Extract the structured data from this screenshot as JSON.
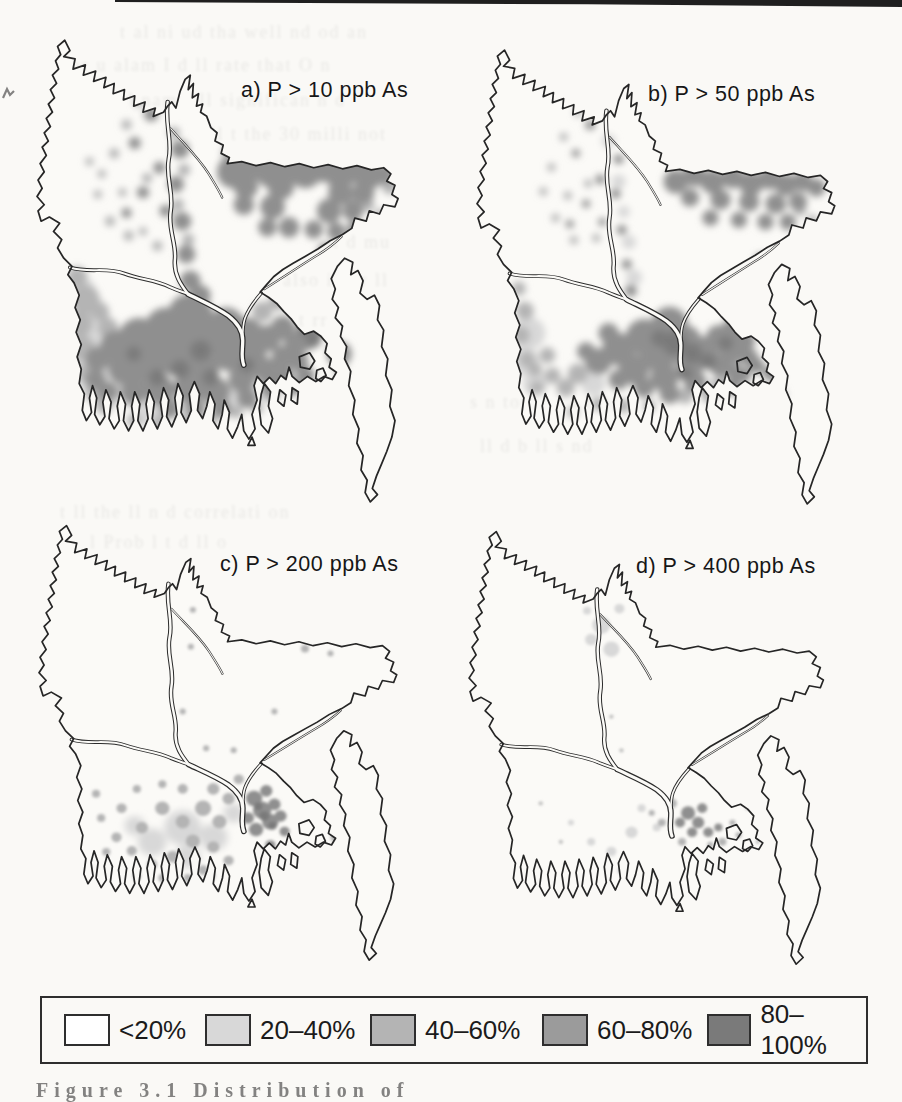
{
  "figure": {
    "maps": [
      {
        "id": "a",
        "title": "a) P > 10 ppb As"
      },
      {
        "id": "b",
        "title": "b) P > 50 ppb As"
      },
      {
        "id": "c",
        "title": "c) P > 200 ppb As"
      },
      {
        "id": "d",
        "title": "d) P > 400 ppb As"
      }
    ],
    "legend": {
      "items": [
        {
          "label": "<20%",
          "color": "#ffffff"
        },
        {
          "label": "20–40%",
          "color": "#d8d8d8"
        },
        {
          "label": "40–60%",
          "color": "#b4b4b4"
        },
        {
          "label": "60–80%",
          "color": "#9b9b9b"
        },
        {
          "label": "80–100%",
          "color": "#7a7a7a"
        }
      ]
    },
    "caption_partial": "Figure 3.1   Distribution of"
  },
  "bleedthrough": {
    "lines": [
      {
        "x": 120,
        "y": 22,
        "size": 18,
        "text": "t al ni  ud  tha  well  nd  od  an"
      },
      {
        "x": 60,
        "y": 55,
        "size": 18,
        "text": "ppr  u  alam  I  d  ll  rate that  O  n"
      },
      {
        "x": 75,
        "y": 90,
        "size": 18,
        "text": "al  r  nd  nam  I  ll  significan  n  d"
      },
      {
        "x": 55,
        "y": 124,
        "size": 18,
        "text": "s the number  r  d  ll  t   the 30 milli  not"
      },
      {
        "x": 90,
        "y": 158,
        "size": 18,
        "text": "d  li  u  t  d  ll  o  nd  t  al"
      },
      {
        "x": 70,
        "y": 192,
        "size": 18,
        "text": "in  th  ll  s  ll  current  coll  r  d"
      },
      {
        "x": 85,
        "y": 232,
        "size": 18,
        "text": "ll  to  pools  n  c  d  t  at present  d  mu"
      },
      {
        "x": 95,
        "y": 270,
        "size": 18,
        "text": "d  M  l  rr  ll  deter  ll  e  also  impr  ll"
      },
      {
        "x": 80,
        "y": 310,
        "size": 18,
        "text": "ti  ll  on  ll  autr  2 5  t  ll  o  t  rr"
      },
      {
        "x": 100,
        "y": 350,
        "size": 18,
        "text": "lt  s  l  hol  ll  W  ll  s  ll  year"
      },
      {
        "x": 470,
        "y": 392,
        "size": 18,
        "text": "s  n  top  t  t  ll  in  r"
      },
      {
        "x": 480,
        "y": 436,
        "size": 18,
        "text": "ll  d  b  ll  s  nd"
      },
      {
        "x": 60,
        "y": 502,
        "size": 18,
        "text": "t  ll  the  ll  n  d  correlati  on"
      },
      {
        "x": 90,
        "y": 532,
        "size": 18,
        "text": "l  Prob  l  t  d  ll  o"
      }
    ]
  }
}
